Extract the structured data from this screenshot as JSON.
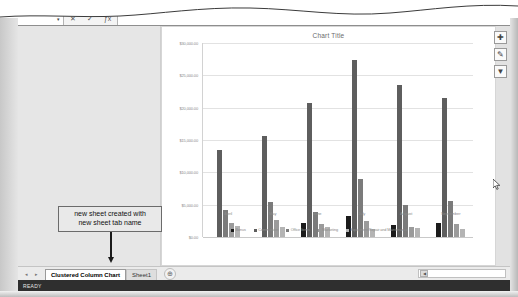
{
  "app": {
    "status_bar_text": "READY"
  },
  "formula_bar": {
    "name_box_value": "",
    "name_box_caret": "▾",
    "cancel_label": "✕",
    "enter_label": "✓",
    "function_label": "ƒx",
    "input_value": ""
  },
  "chart_buttons": [
    {
      "name": "chart-elements-button",
      "glyph": "✚"
    },
    {
      "name": "chart-styles-button",
      "glyph": "✎"
    },
    {
      "name": "chart-filters-button",
      "glyph": "▼"
    }
  ],
  "annotation": {
    "line1": "new sheet created with",
    "line2": "new sheet tab name"
  },
  "tab_bar": {
    "nav_prev": "◂",
    "nav_next": "▸",
    "tabs": [
      {
        "label": "Clustered Column Chart",
        "active": true
      },
      {
        "label": "Sheet1",
        "active": false
      }
    ],
    "add_sheet_label": "⊕",
    "scroll_arrow": "◀"
  },
  "chart_data": {
    "type": "bar",
    "title": "Chart Title",
    "xlabel": "",
    "ylabel": "",
    "ylim": [
      0,
      30000
    ],
    "ytick_step": 5000,
    "grid": true,
    "legend_position": "bottom",
    "ytick_labels": [
      "$30,000.00",
      "$25,000.00",
      "$20,000.00",
      "$15,000.00",
      "$10,000.00",
      "$5,000.00",
      "$0.00"
    ],
    "ytick_values": [
      30000,
      25000,
      20000,
      15000,
      10000,
      5000,
      0
    ],
    "categories": [
      "April",
      "May",
      "June",
      "July",
      "August",
      "September"
    ],
    "series": [
      {
        "name": "Bonus",
        "color": "#1b1b1b",
        "values": [
          0,
          0,
          2200,
          3200,
          1800,
          2100
        ]
      },
      {
        "name": "Commission",
        "color": "#5e5e5e",
        "values": [
          13500,
          15600,
          20800,
          27400,
          23500,
          21500
        ]
      },
      {
        "name": "Office Items",
        "color": "#7b7b7b",
        "values": [
          4200,
          5400,
          3900,
          9000,
          4900,
          5600
        ]
      },
      {
        "name": "Marketing",
        "color": "#9b9b9b",
        "values": [
          2100,
          2600,
          2000,
          2400,
          1600,
          2000
        ]
      },
      {
        "name": "Equipment Repair and Maintenance",
        "color": "#b4b4b4",
        "values": [
          1700,
          1600,
          1500,
          1200,
          1400,
          1300
        ]
      }
    ]
  }
}
